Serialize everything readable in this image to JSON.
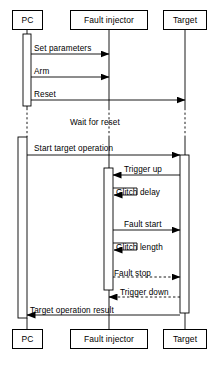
{
  "diagram": {
    "type": "sequence-diagram",
    "stroke_color": "#000000",
    "background_color": "#ffffff",
    "participants": [
      {
        "id": "pc",
        "label": "PC",
        "x": 27
      },
      {
        "id": "fault_injector",
        "label": "Fault injector",
        "x": 109
      },
      {
        "id": "target",
        "label": "Target",
        "x": 185
      }
    ],
    "header_boxes": {
      "pc": {
        "label": "PC",
        "left": 12,
        "top": 10,
        "width": 31,
        "height": 20
      },
      "fault_injector": {
        "label": "Fault injector",
        "left": 70,
        "top": 10,
        "width": 78,
        "height": 20
      },
      "target": {
        "label": "Target",
        "left": 163,
        "top": 10,
        "width": 44,
        "height": 20
      }
    },
    "footer_boxes": {
      "pc": {
        "label": "PC",
        "left": 12,
        "top": 329,
        "width": 31,
        "height": 20
      },
      "fault_injector": {
        "label": "Fault injector",
        "left": 70,
        "top": 329,
        "width": 78,
        "height": 20
      },
      "target": {
        "label": "Target",
        "left": 163,
        "top": 329,
        "width": 44,
        "height": 20
      }
    },
    "notes": [
      {
        "id": "wait-for-reset",
        "text": "Wait for reset",
        "x": 70,
        "y": 119
      }
    ],
    "messages": [
      {
        "id": "set-parameters",
        "label": "Set parameters",
        "from": "pc",
        "to": "fault_injector",
        "direction": "right",
        "style": "solid",
        "kind": "call",
        "y": 54,
        "label_x": 34,
        "label_y": 45
      },
      {
        "id": "arm",
        "label": "Arm",
        "from": "pc",
        "to": "fault_injector",
        "direction": "right",
        "style": "solid",
        "kind": "call",
        "y": 77,
        "label_x": 34,
        "label_y": 68
      },
      {
        "id": "reset",
        "label": "Reset",
        "from": "pc",
        "to": "target",
        "direction": "right",
        "style": "solid",
        "kind": "call",
        "y": 100,
        "label_x": 34,
        "label_y": 91
      },
      {
        "id": "start-target-operation",
        "label": "Start target operation",
        "from": "pc",
        "to": "target",
        "direction": "right",
        "style": "solid",
        "kind": "call",
        "y": 155,
        "label_x": 34,
        "label_y": 145
      },
      {
        "id": "trigger-up",
        "label": "Trigger up",
        "from": "target",
        "to": "fault_injector",
        "direction": "left",
        "style": "solid",
        "kind": "call",
        "y": 175,
        "label_x": 124,
        "label_y": 166
      },
      {
        "id": "glitch-delay",
        "label": "Glitch delay",
        "from": "fault_injector",
        "to": "fault_injector",
        "direction": "self",
        "style": "solid",
        "kind": "self",
        "y": 195,
        "label_x": 116,
        "label_y": 189
      },
      {
        "id": "fault-start",
        "label": "Fault start",
        "from": "fault_injector",
        "to": "target",
        "direction": "right",
        "style": "solid",
        "kind": "call",
        "y": 230,
        "label_x": 124,
        "label_y": 221
      },
      {
        "id": "glitch-length",
        "label": "Glitch length",
        "from": "fault_injector",
        "to": "fault_injector",
        "direction": "self",
        "style": "solid",
        "kind": "self",
        "y": 250,
        "label_x": 116,
        "label_y": 244
      },
      {
        "id": "fault-stop",
        "label": "Fault stop",
        "from": "fault_injector",
        "to": "target",
        "direction": "right",
        "style": "dashed",
        "kind": "return",
        "y": 277,
        "label_x": 114,
        "label_y": 270
      },
      {
        "id": "trigger-down",
        "label": "Trigger down",
        "from": "target",
        "to": "fault_injector",
        "direction": "left",
        "style": "dashed",
        "kind": "return",
        "y": 297,
        "label_x": 120,
        "label_y": 289
      },
      {
        "id": "target-operation-result",
        "label": "Target operation result",
        "from": "target",
        "to": "pc",
        "direction": "left",
        "style": "solid",
        "kind": "return",
        "y": 315,
        "label_x": 30,
        "label_y": 307
      }
    ],
    "activations": [
      {
        "id": "pc-activation-top",
        "participant": "pc",
        "x": 23,
        "y": 34,
        "width": 8,
        "height": 72
      },
      {
        "id": "pc-activation-main",
        "participant": "pc",
        "x": 18,
        "y": 137,
        "width": 9,
        "height": 181
      },
      {
        "id": "fault-injector-activation",
        "participant": "fault_injector",
        "x": 104,
        "y": 168,
        "width": 9,
        "height": 122
      },
      {
        "id": "target-activation",
        "participant": "target",
        "x": 180,
        "y": 155,
        "width": 9,
        "height": 158
      }
    ],
    "lifeline_segments": [
      {
        "participant": "pc",
        "x": 27,
        "y1": 30,
        "y2": 108,
        "style": "solid"
      },
      {
        "participant": "pc",
        "x": 27,
        "y1": 108,
        "y2": 137,
        "style": "dashed"
      },
      {
        "participant": "pc",
        "x": 27,
        "y1": 318,
        "y2": 329,
        "style": "solid"
      },
      {
        "participant": "fault_injector",
        "x": 109,
        "y1": 30,
        "y2": 108,
        "style": "solid"
      },
      {
        "participant": "fault_injector",
        "x": 109,
        "y1": 108,
        "y2": 137,
        "style": "dashed"
      },
      {
        "participant": "fault_injector",
        "x": 109,
        "y1": 137,
        "y2": 168,
        "style": "solid"
      },
      {
        "participant": "fault_injector",
        "x": 109,
        "y1": 290,
        "y2": 329,
        "style": "solid"
      },
      {
        "participant": "target",
        "x": 185,
        "y1": 30,
        "y2": 108,
        "style": "solid"
      },
      {
        "participant": "target",
        "x": 185,
        "y1": 108,
        "y2": 137,
        "style": "dashed"
      },
      {
        "participant": "target",
        "x": 185,
        "y1": 137,
        "y2": 155,
        "style": "solid"
      },
      {
        "participant": "target",
        "x": 185,
        "y1": 313,
        "y2": 329,
        "style": "solid"
      }
    ]
  }
}
